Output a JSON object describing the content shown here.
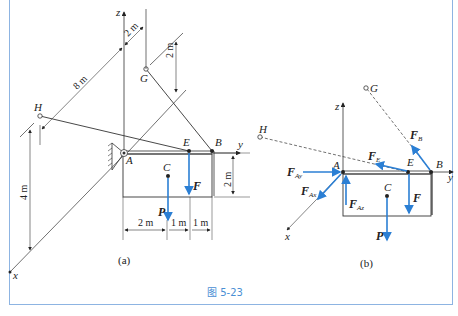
{
  "figure": {
    "caption": "图 5-23",
    "colors": {
      "force": "#2b7fd4",
      "frame": "#8db4e2",
      "caption": "#4a8fd4",
      "line": "#333333"
    }
  },
  "panel_a": {
    "label": "(a)",
    "points": {
      "A": "A",
      "B": "B",
      "C": "C",
      "E": "E",
      "G": "G",
      "H": "H"
    },
    "axes": {
      "x": "x",
      "y": "y",
      "z": "z"
    },
    "forces": {
      "P": "P",
      "F": "F"
    },
    "dimensions": {
      "d_2m_top": "2 m",
      "d_8m": "8 m",
      "d_2m_G": "2 m",
      "d_4m": "4 m",
      "d_2m_height": "2 m",
      "d_2m_bottom": "2 m",
      "d_1m_a": "1 m",
      "d_1m_b": "1 m"
    }
  },
  "panel_b": {
    "label": "(b)",
    "points": {
      "A": "A",
      "B": "B",
      "C": "C",
      "E": "E",
      "G": "G",
      "H": "H"
    },
    "axes": {
      "x": "x",
      "y": "y",
      "z": "z"
    },
    "forces": {
      "FAy": {
        "main": "F",
        "sub": "Ay"
      },
      "FAx": {
        "main": "F",
        "sub": "Ax"
      },
      "FAz": {
        "main": "F",
        "sub": "Az"
      },
      "FE": {
        "main": "F",
        "sub": "E"
      },
      "FB": {
        "main": "F",
        "sub": "B"
      },
      "F": "F",
      "P": "P"
    }
  }
}
